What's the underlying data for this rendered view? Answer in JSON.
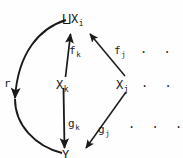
{
  "diagram": {
    "type": "commutative-diagram",
    "nodes": [
      {
        "id": "coproduct",
        "symbol": "⨿",
        "base": "X",
        "sub": "i",
        "x": 64,
        "y": 12
      },
      {
        "id": "x-k",
        "symbol": "",
        "base": "X",
        "sub": "k",
        "x": 56,
        "y": 80
      },
      {
        "id": "x-j",
        "symbol": "",
        "base": "X",
        "sub": "j",
        "x": 116,
        "y": 80
      },
      {
        "id": "y-bottom",
        "symbol": "",
        "base": "Y",
        "sub": "",
        "x": 66,
        "y": 148
      }
    ],
    "arrow_labels": [
      {
        "id": "f-k",
        "base": "f",
        "sub": "k",
        "x": 69,
        "y": 47
      },
      {
        "id": "f-j",
        "base": "f",
        "sub": "j",
        "x": 115,
        "y": 47
      },
      {
        "id": "g-k",
        "base": "g",
        "sub": "k",
        "x": 68,
        "y": 119
      },
      {
        "id": "g-j",
        "base": "g",
        "sub": "j",
        "x": 99,
        "y": 125
      },
      {
        "id": "r",
        "base": "r",
        "sub": "",
        "x": 4,
        "y": 79
      }
    ],
    "ellipses": [
      {
        "id": "ellipsis-top",
        "text": "· · ·",
        "x": 140,
        "y": 48
      },
      {
        "id": "ellipsis-middle",
        "text": "· · ·",
        "x": 141,
        "y": 82
      },
      {
        "id": "ellipsis-bottom",
        "text": "· · ·",
        "x": 128,
        "y": 123
      }
    ],
    "colors": {
      "ink": "#1a1a1a",
      "background": "#fefefe"
    }
  }
}
